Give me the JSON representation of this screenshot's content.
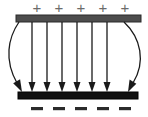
{
  "figure": {
    "background_color": "#ffffff",
    "width": 148,
    "height": 117
  },
  "top_plate": {
    "name": "positive-plate",
    "color": "#4d4d4d",
    "edge_color": "#2b2b2b",
    "x": 16,
    "y": 15,
    "width": 125,
    "height": 7,
    "polarity": "positive"
  },
  "bottom_plate": {
    "name": "negative-plate",
    "color": "#111111",
    "edge_color": "#000000",
    "x": 18,
    "y": 92,
    "width": 120,
    "height": 7,
    "polarity": "negative"
  },
  "positive_charges": {
    "symbol": "+",
    "count": 5,
    "color": "#6b6b6b",
    "font_size": 15,
    "y": 8,
    "x_positions": [
      37,
      59,
      81,
      103,
      125
    ],
    "labels": [
      "+",
      "+",
      "+",
      "+",
      "+"
    ]
  },
  "negative_charges": {
    "symbol": "−",
    "count": 5,
    "color": "#2b2b2b",
    "font_size": 17,
    "y": 107,
    "x_positions": [
      37,
      59,
      81,
      103,
      125
    ],
    "labels": [
      "−",
      "−",
      "−",
      "−",
      "−"
    ]
  },
  "field_lines": {
    "color": "#1a1a1a",
    "stroke_width": 1.3,
    "direction": "downward",
    "count": 8,
    "straight_count": 6,
    "fringe_count": 2,
    "start_y": 22,
    "end_y": 91,
    "straight_x": [
      32,
      47,
      62,
      77,
      92,
      107
    ],
    "fringe": [
      {
        "name": "left-fringe-line",
        "start_x": 19,
        "end_x": 21,
        "bulge_x": 4
      },
      {
        "name": "right-fringe-line",
        "start_x": 124,
        "end_x": 135,
        "bulge_x": 146
      }
    ],
    "arrowhead": {
      "width": 7,
      "length": 9
    }
  }
}
